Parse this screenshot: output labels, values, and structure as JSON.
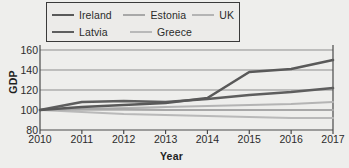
{
  "chart_data": {
    "type": "line",
    "title": "",
    "xlabel": "Year",
    "ylabel": "GDP",
    "x": [
      2010,
      2011,
      2012,
      2013,
      2014,
      2015,
      2016,
      2017
    ],
    "xticklabels": [
      "2010",
      "2011",
      "2012",
      "2013",
      "2014",
      "2015",
      "2016",
      "2017"
    ],
    "yticklabels": [
      "80",
      "100",
      "120",
      "140",
      "160"
    ],
    "yticks": [
      80,
      100,
      120,
      140,
      160
    ],
    "ylim": [
      80,
      162
    ],
    "xlim": [
      2010,
      2017
    ],
    "grid": "horizontal",
    "legend_position": "top",
    "series": [
      {
        "name": "Ireland",
        "color": "#595959",
        "width": 2.6,
        "values": [
          100,
          103,
          105,
          107,
          112,
          138,
          141,
          150
        ]
      },
      {
        "name": "Latvia",
        "color": "#5e5e5e",
        "width": 2.6,
        "values": [
          100,
          108,
          109,
          108,
          111,
          115,
          118,
          122
        ]
      },
      {
        "name": "Estonia",
        "color": "#a8a8a8",
        "width": 2.2,
        "values": [
          100,
          101,
          101,
          100,
          100,
          100,
          100,
          100
        ]
      },
      {
        "name": "UK",
        "color": "#b4b4b4",
        "width": 2.2,
        "values": [
          100,
          101,
          102,
          103,
          104,
          105,
          106,
          108
        ]
      },
      {
        "name": "Greece",
        "color": "#b9b9b9",
        "width": 2.2,
        "values": [
          100,
          98,
          96,
          95,
          94,
          93,
          92,
          92
        ]
      }
    ]
  },
  "legend": {
    "rows": [
      [
        "Ireland",
        "Estonia",
        "UK"
      ],
      [
        "Latvia",
        "Greece"
      ]
    ]
  },
  "colors": {
    "background": "#eeeeec",
    "axis": "#4a4a4a",
    "grid": "#8d8d8d",
    "text": "#2b2b2b"
  }
}
